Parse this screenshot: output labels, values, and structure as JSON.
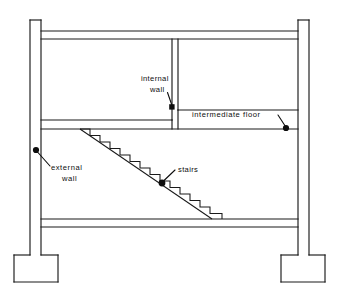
{
  "diagram": {
    "type": "architectural-section",
    "ink_color": "#1a1a1a",
    "background_color": "#ffffff",
    "annotations": [
      {
        "id": "internal-wall",
        "line1": "internal",
        "line2": "wall",
        "marker": "square",
        "marker_x": 172,
        "marker_y": 107,
        "text_x": 141,
        "text_y": 81,
        "text2_x": 147,
        "text2_y": 92,
        "leader": "M 167.5 92.5 L 172 105.5"
      },
      {
        "id": "intermediate-floor",
        "line1": "intermediate   floor",
        "line2": "",
        "marker": "dot",
        "marker_x": 286,
        "marker_y": 128,
        "text_x": 192,
        "text_y": 117,
        "text2_x": 0,
        "text2_y": 0,
        "leader": "M 278 115 L 285.5 126.5"
      },
      {
        "id": "external-wall",
        "line1": "external",
        "line2": "wall",
        "marker": "dot",
        "marker_x": 36,
        "marker_y": 150,
        "text_x": 51,
        "text_y": 170,
        "text2_x": 60,
        "text2_y": 181,
        "leader": "M 37.5 152 L 50 166"
      },
      {
        "id": "stairs",
        "line1": "stairs",
        "line2": "",
        "marker": "dot",
        "marker_x": 162,
        "marker_y": 183,
        "text_x": 178,
        "text_y": 172,
        "text2_x": 0,
        "text2_y": 0,
        "leader": "M 175 170 L 163.5 181"
      }
    ],
    "geometry": {
      "left_column_outer_x": 30,
      "left_column_inner_x": 41,
      "right_column_inner_x": 298,
      "right_column_outer_x": 309,
      "column_top_y": 20,
      "roof_slab_top_y": 31,
      "roof_slab_bottom_y": 39,
      "intermediate_floor_left_top_y": 120,
      "intermediate_floor_left_bottom_y": 129,
      "intermediate_floor_right_top_y": 110,
      "intermediate_floor_right_bottom_y": 129,
      "ground_slab_top_y": 219,
      "ground_slab_bottom_y": 227,
      "footing_top_y": 255,
      "footing_bottom_y": 282,
      "internal_wall_x_left": 172,
      "internal_wall_x_right": 178,
      "internal_wall_top_y": 39,
      "internal_wall_bottom_y": 120,
      "stair_top_x": 80,
      "stair_top_y": 129,
      "stair_bottom_x": 222,
      "stair_bottom_y": 219,
      "stair_step_count": 14
    }
  }
}
